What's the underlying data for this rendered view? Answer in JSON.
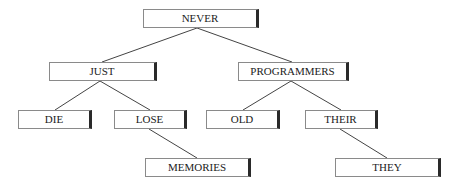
{
  "diagram": {
    "type": "tree",
    "nodes": [
      {
        "id": "never",
        "label": "NEVER",
        "x": 143,
        "y": 9,
        "w": 116,
        "h": 19
      },
      {
        "id": "just",
        "label": "JUST",
        "x": 49,
        "y": 62,
        "w": 108,
        "h": 19
      },
      {
        "id": "programmers",
        "label": "PROGRAMMERS",
        "x": 238,
        "y": 62,
        "w": 111,
        "h": 19
      },
      {
        "id": "die",
        "label": "DIE",
        "x": 18,
        "y": 110,
        "w": 74,
        "h": 19
      },
      {
        "id": "lose",
        "label": "LOSE",
        "x": 114,
        "y": 110,
        "w": 73,
        "h": 19
      },
      {
        "id": "old",
        "label": "OLD",
        "x": 206,
        "y": 110,
        "w": 74,
        "h": 19
      },
      {
        "id": "their",
        "label": "THEIR",
        "x": 305,
        "y": 110,
        "w": 73,
        "h": 19
      },
      {
        "id": "memories",
        "label": "MEMORIES",
        "x": 145,
        "y": 158,
        "w": 106,
        "h": 19
      },
      {
        "id": "they",
        "label": "THEY",
        "x": 335,
        "y": 158,
        "w": 106,
        "h": 19
      }
    ],
    "edges": [
      {
        "from": "never",
        "to": "just"
      },
      {
        "from": "never",
        "to": "programmers"
      },
      {
        "from": "just",
        "to": "die"
      },
      {
        "from": "just",
        "to": "lose"
      },
      {
        "from": "programmers",
        "to": "old"
      },
      {
        "from": "programmers",
        "to": "their"
      },
      {
        "from": "lose",
        "to": "memories"
      },
      {
        "from": "their",
        "to": "they"
      }
    ]
  },
  "labels": {
    "never": "NEVER",
    "just": "JUST",
    "programmers": "PROGRAMMERS",
    "die": "DIE",
    "lose": "LOSE",
    "old": "OLD",
    "their": "THEIR",
    "memories": "MEMORIES",
    "they": "THEY"
  }
}
